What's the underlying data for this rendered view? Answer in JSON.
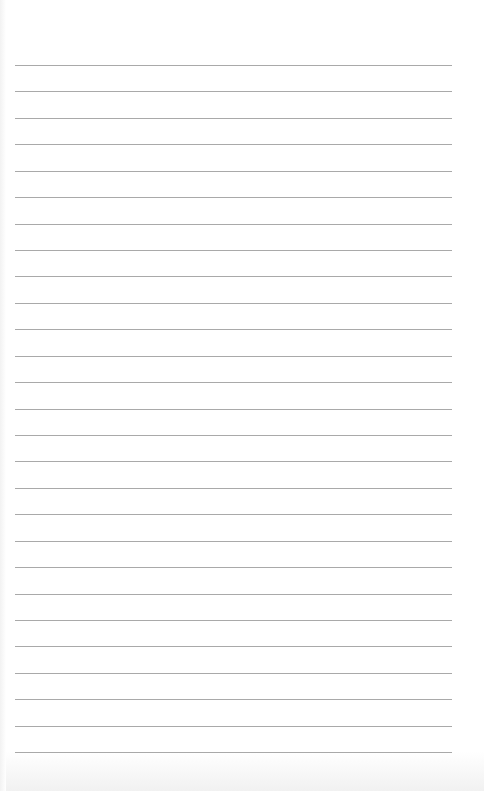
{
  "paper": {
    "type": "ruled-lined-paper",
    "background_color": "#ffffff",
    "line_color": "#a9a9a9",
    "line_count": 27,
    "first_line_y": 65,
    "line_spacing": 26.43,
    "line_left_x": 15,
    "line_right_x": 452
  }
}
